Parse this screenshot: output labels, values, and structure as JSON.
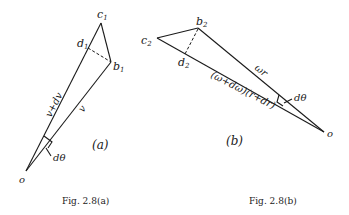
{
  "figure_a": {
    "labels": {
      "c": "c",
      "c_sub": "1",
      "d": "d",
      "d_sub": "1",
      "b": "b",
      "b_sub": "1",
      "o": "o",
      "side_long": "v+dv",
      "side_short": "v",
      "angle": "dθ",
      "panel": "(a)"
    },
    "caption": "Fig. 2.8(a)"
  },
  "figure_b": {
    "labels": {
      "c": "c",
      "c_sub": "2",
      "b": "b",
      "b_sub": "2",
      "d": "d",
      "d_sub": "2",
      "o": "o",
      "side_short": "ωr",
      "side_long": "(ω+dω)(r+dr)",
      "angle": "dθ",
      "panel": "(b)"
    },
    "caption": "Fig. 2.8(b)"
  }
}
